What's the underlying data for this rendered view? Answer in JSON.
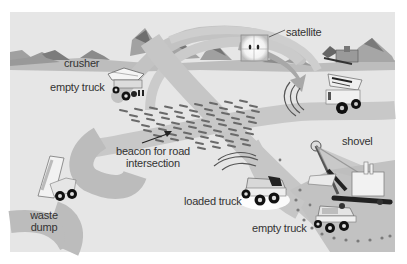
{
  "diagram": {
    "labels": {
      "crusher": "crusher",
      "satellite": "satellite",
      "empty_truck_top": "empty truck",
      "beacon": "beacon for road intersection",
      "beacon_line1": "beacon for road",
      "beacon_line2": "intersection",
      "waste_dump_line1": "waste",
      "waste_dump_line2": "dump",
      "shovel": "shovel",
      "loaded_truck": "loaded truck",
      "empty_truck_bottom": "empty truck"
    },
    "caption": "",
    "colors": {
      "background": "#e6e6e6",
      "road": "#c6c6c6",
      "road_dark": "#b4b4b4",
      "mountain": "#a8a8a8",
      "mountain_dark": "#7a7a7a",
      "ground_band": "#b8b8b8",
      "text": "#333333",
      "beacon_dash": "#6a6a6a"
    }
  }
}
